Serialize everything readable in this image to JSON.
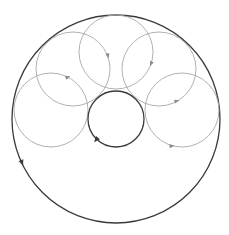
{
  "diagram": {
    "title": "",
    "outer_circle": {
      "role": "outer",
      "color": "#3a3a3a",
      "arrow_direction": "counterclockwise"
    },
    "inner_circle": {
      "role": "inner",
      "color": "#3a3a3a",
      "arrow_direction": "clockwise"
    },
    "chain_circles": [
      {
        "id": "left",
        "color": "#a8a8a8",
        "arrow_direction": "clockwise"
      },
      {
        "id": "upper-left",
        "color": "#a8a8a8",
        "arrow_direction": "clockwise"
      },
      {
        "id": "top",
        "color": "#a8a8a8",
        "arrow_direction": "clockwise"
      },
      {
        "id": "upper-right",
        "color": "#a8a8a8",
        "arrow_direction": "counterclockwise"
      },
      {
        "id": "right",
        "color": "#a8a8a8",
        "arrow_direction": "counterclockwise"
      }
    ],
    "chain_count": 5
  }
}
